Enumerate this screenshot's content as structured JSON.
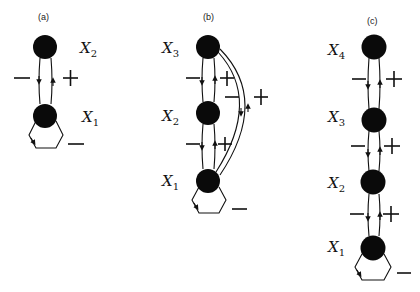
{
  "panels": [
    {
      "id": "a",
      "label": "(a)",
      "nodes": [
        {
          "name": "x2",
          "var": "X",
          "sub": "2"
        },
        {
          "name": "x1",
          "var": "X",
          "sub": "1"
        }
      ],
      "edges": [
        {
          "from": "x2",
          "to": "x1",
          "sign": "−"
        },
        {
          "from": "x1",
          "to": "x2",
          "sign": "+"
        },
        {
          "from": "x1",
          "to": "x1",
          "sign": "−",
          "type": "self-loop"
        }
      ]
    },
    {
      "id": "b",
      "label": "(b)",
      "nodes": [
        {
          "name": "x3",
          "var": "X",
          "sub": "3"
        },
        {
          "name": "x2",
          "var": "X",
          "sub": "2"
        },
        {
          "name": "x1",
          "var": "X",
          "sub": "1"
        }
      ],
      "edges": [
        {
          "from": "x3",
          "to": "x2",
          "sign": "−"
        },
        {
          "from": "x2",
          "to": "x3",
          "sign": "+"
        },
        {
          "from": "x2",
          "to": "x1",
          "sign": "−"
        },
        {
          "from": "x1",
          "to": "x2",
          "sign": "+"
        },
        {
          "from": "x3",
          "to": "x1",
          "sign": "−"
        },
        {
          "from": "x1",
          "to": "x3",
          "sign": "+"
        },
        {
          "from": "x1",
          "to": "x1",
          "sign": "−",
          "type": "self-loop"
        }
      ]
    },
    {
      "id": "c",
      "label": "(c)",
      "nodes": [
        {
          "name": "x4",
          "var": "X",
          "sub": "4"
        },
        {
          "name": "x3",
          "var": "X",
          "sub": "3"
        },
        {
          "name": "x2",
          "var": "X",
          "sub": "2"
        },
        {
          "name": "x1",
          "var": "X",
          "sub": "1"
        }
      ],
      "edges": [
        {
          "from": "x4",
          "to": "x3",
          "sign": "−"
        },
        {
          "from": "x3",
          "to": "x4",
          "sign": "+"
        },
        {
          "from": "x3",
          "to": "x2",
          "sign": "−"
        },
        {
          "from": "x2",
          "to": "x3",
          "sign": "+"
        },
        {
          "from": "x2",
          "to": "x1",
          "sign": "−"
        },
        {
          "from": "x1",
          "to": "x2",
          "sign": "+"
        },
        {
          "from": "x1",
          "to": "x1",
          "sign": "−",
          "type": "self-loop"
        }
      ]
    }
  ]
}
